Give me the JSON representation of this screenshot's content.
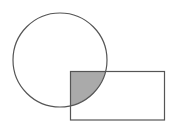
{
  "diagram": {
    "circle": {
      "cx": 60,
      "cy": 60,
      "r": 47,
      "stroke": "#555555"
    },
    "rectangle": {
      "x": 70.5,
      "y": 71.5,
      "width": 94,
      "height": 48.5,
      "stroke": "#555555"
    },
    "intersection_fill": "#aaaaaa"
  }
}
